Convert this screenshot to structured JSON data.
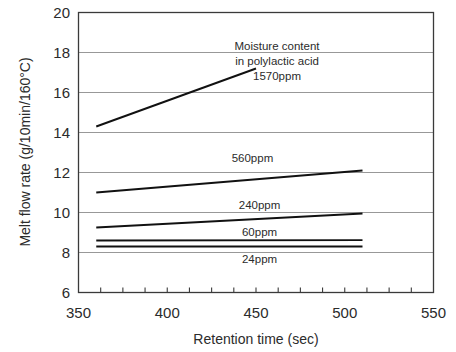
{
  "chart_data": {
    "type": "line",
    "title": "",
    "xlabel": "Retention time (sec)",
    "ylabel": "Melt flow rate (g/10min/160°C)",
    "xlim": [
      350,
      550
    ],
    "ylim": [
      6,
      20
    ],
    "xticks": [
      350,
      400,
      450,
      500,
      550
    ],
    "xtick_labels": [
      "350",
      "400",
      "450",
      "500",
      "550"
    ],
    "xminor_step": 12.5,
    "yticks": [
      6,
      8,
      10,
      12,
      14,
      16,
      18,
      20
    ],
    "ytick_labels": [
      "6",
      "8",
      "10",
      "12",
      "14",
      "16",
      "18",
      "20"
    ],
    "grid": "horizontal",
    "legend_position": "inline-annotations",
    "annotation": {
      "line1": "Moisture content",
      "line2": "in polylactic acid",
      "line3": "1570ppm"
    },
    "series": [
      {
        "name": "1570ppm",
        "label": "1570ppm",
        "x": [
          360,
          450
        ],
        "values": [
          14.3,
          17.2
        ],
        "label_x": 420,
        "label_y": 17.0
      },
      {
        "name": "560ppm",
        "label": "560ppm",
        "x": [
          360,
          510
        ],
        "values": [
          11.0,
          12.1
        ],
        "label_x": 448,
        "label_y": 12.75
      },
      {
        "name": "240ppm",
        "label": "240ppm",
        "x": [
          360,
          510
        ],
        "values": [
          9.25,
          9.95
        ],
        "label_x": 452,
        "label_y": 10.4
      },
      {
        "name": "60ppm",
        "label": "60ppm",
        "x": [
          360,
          510
        ],
        "values": [
          8.6,
          8.62
        ],
        "label_x": 452,
        "label_y": 9.05
      },
      {
        "name": "24ppm",
        "label": "24ppm",
        "x": [
          360,
          510
        ],
        "values": [
          8.3,
          8.3
        ],
        "label_x": 452,
        "label_y": 7.7
      }
    ]
  },
  "colors": {
    "background": "#ffffff",
    "frame": "#3a3a3a",
    "grid": "#8c8c8c",
    "data": "#111111",
    "text": "#2b2b2b"
  }
}
